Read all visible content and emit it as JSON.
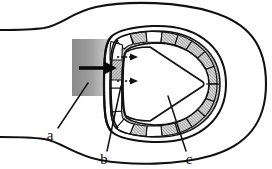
{
  "figure": {
    "title": "",
    "type": "schematic-diagram",
    "background_color": "#ffffff",
    "stroke_color": "#111111",
    "labels": [
      {
        "id": "a",
        "text": "a",
        "x": 50,
        "y": 135,
        "leader_from_x": 58,
        "leader_from_y": 128,
        "leader_to_x": 88,
        "leader_to_y": 84,
        "describes": "gradient-square-region"
      },
      {
        "id": "b",
        "text": "b",
        "x": 104,
        "y": 160,
        "leader_from_x": 107,
        "leader_from_y": 152,
        "leader_to_x": 120,
        "leader_to_y": 88,
        "describes": "leading-edge-membrane"
      },
      {
        "id": "c",
        "text": "c",
        "x": 188,
        "y": 160,
        "leader_from_x": 187,
        "leader_from_y": 152,
        "leader_to_x": 168,
        "leader_to_y": 96,
        "describes": "segmented-cell-band"
      }
    ],
    "gradient_square": {
      "x": 72,
      "y": 39,
      "width": 42,
      "height": 57,
      "color_left": "#8f8f8f",
      "color_right": "#d8d8d8",
      "direction": "left-to-right-lightening"
    },
    "main_arrow": {
      "name": "bold-input-arrow",
      "from_x": 80,
      "from_y": 68,
      "to_x": 113,
      "to_y": 68,
      "color": "#0a0a0a",
      "thickness": 4
    },
    "inner_arrows": [
      {
        "name": "dashed-arrow-upper",
        "from_x": 118,
        "from_y": 57,
        "to_x": 137,
        "to_y": 57,
        "color": "#111111",
        "style": "dashed-tail"
      },
      {
        "name": "dashed-arrow-lower",
        "from_x": 118,
        "from_y": 81,
        "to_x": 137,
        "to_y": 81,
        "color": "#111111",
        "style": "dashed-tail"
      }
    ],
    "segmented_band": {
      "name": "horseshoe-cell-band",
      "segment_count": 22,
      "fill_alternating": true,
      "fill_gray": "#b8b8b8",
      "fill_white": "#ffffff",
      "hatch": "cross-hatch"
    },
    "outer_body": {
      "name": "body-outline",
      "fill": "#ffffff",
      "stroke_width": 2
    },
    "horseshoe_outline": {
      "name": "horseshoe-outline",
      "fill": "#ffffff",
      "stroke_width": 2
    },
    "inner_cavity": {
      "name": "inner-cavity-wedge",
      "fill": "#ffffff",
      "stroke_width": 1.6
    }
  }
}
